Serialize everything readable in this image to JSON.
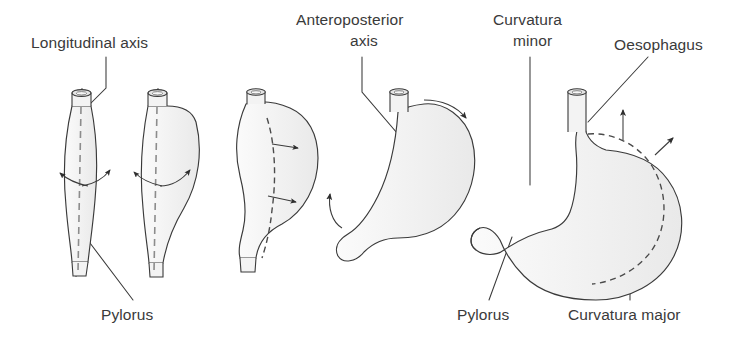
{
  "figure": {
    "background_color": "#ffffff",
    "organ_fill_color": "#f2f2f2",
    "outline_color": "#3c3c3c",
    "text_color": "#3a3a3a"
  },
  "labels": {
    "longitudinal_axis": "Longitudinal axis",
    "anteroposterior_axis_line1": "Anteroposterior",
    "anteroposterior_axis_line2": "axis",
    "curvatura_minor_line1": "Curvatura",
    "curvatura_minor_line2": "minor",
    "oesophagus": "Oesophagus",
    "pylorus_left": "Pylorus",
    "pylorus_right": "Pylorus",
    "curvatura_major": "Curvatura major"
  },
  "stages": [
    {
      "index": 1,
      "name": "stage-1-tubular-stomach",
      "description": "Straight tubular stomach with dashed longitudinal axis and outward rotation arrows",
      "has_longitudinal_axis": true,
      "has_rotation_arrows": true
    },
    {
      "index": 2,
      "name": "stage-2-curving-stomach",
      "description": "Stomach beginning to curve with dashed longitudinal axis and rotation arrows",
      "has_longitudinal_axis": true,
      "has_rotation_arrows": true
    },
    {
      "index": 3,
      "name": "stage-3-sigmoid-stomach",
      "description": "Sigmoid-shaped stomach with dashed interior curve and two arrows",
      "has_longitudinal_axis": false,
      "has_rotation_arrows": true
    },
    {
      "index": 4,
      "name": "stage-4-rotated-stomach",
      "description": "Rotated stomach with anteroposterior axis point and curved rotation arrows",
      "has_axis_point": true,
      "has_rotation_arrows": true
    },
    {
      "index": 5,
      "name": "stage-5-definitive-stomach",
      "description": "Definitive stomach with oesophagus, pylorus, curvatura minor and curvatura major",
      "has_dashed_curve": true,
      "has_rotation_arrows": true
    }
  ],
  "anatomical_parts": [
    "oesophagus",
    "pylorus",
    "curvatura-minor",
    "curvatura-major",
    "longitudinal-axis",
    "anteroposterior-axis"
  ]
}
